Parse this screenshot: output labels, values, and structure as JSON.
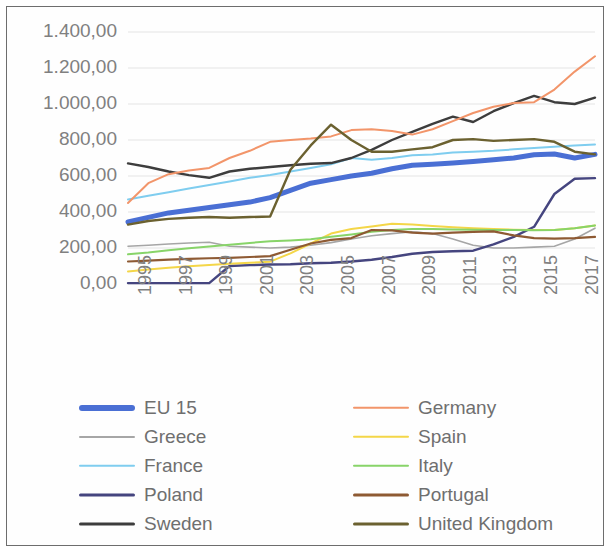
{
  "chart_data": {
    "type": "line",
    "title": "",
    "xlabel": "",
    "ylabel": "",
    "xlim": [
      1995,
      2018
    ],
    "ylim": [
      0,
      1400
    ],
    "grid": true,
    "legend_position": "bottom",
    "y_ticks": [
      "0,00",
      "200,00",
      "400,00",
      "600,00",
      "800,00",
      "1.000,00",
      "1.200,00",
      "1.400,00"
    ],
    "y_tick_values": [
      0,
      200,
      400,
      600,
      800,
      1000,
      1200,
      1400
    ],
    "x_tick_labels": [
      "1995",
      "1997",
      "1999",
      "2001",
      "2003",
      "2005",
      "2007",
      "2009",
      "2011",
      "2013",
      "2015",
      "2017"
    ],
    "x": [
      1995,
      1996,
      1997,
      1998,
      1999,
      2000,
      2001,
      2002,
      2003,
      2004,
      2005,
      2006,
      2007,
      2008,
      2009,
      2010,
      2011,
      2012,
      2013,
      2014,
      2015,
      2016,
      2017,
      2018
    ],
    "series": [
      {
        "name": "EU 15",
        "color": "#4a6fd4",
        "width": 5,
        "values": [
          345,
          370,
          395,
          410,
          425,
          440,
          455,
          480,
          520,
          560,
          580,
          600,
          615,
          640,
          660,
          665,
          672,
          680,
          690,
          700,
          718,
          722,
          700,
          720
        ]
      },
      {
        "name": "Greece",
        "color": "#a6a6a6",
        "width": 1.6,
        "values": [
          210,
          215,
          222,
          228,
          232,
          210,
          205,
          200,
          205,
          215,
          230,
          250,
          268,
          280,
          290,
          280,
          250,
          215,
          200,
          200,
          205,
          210,
          250,
          310
        ]
      },
      {
        "name": "France",
        "color": "#7fcdef",
        "width": 2,
        "values": [
          470,
          490,
          510,
          530,
          550,
          570,
          590,
          605,
          625,
          645,
          665,
          700,
          690,
          700,
          715,
          720,
          730,
          735,
          740,
          748,
          755,
          762,
          770,
          775
        ]
      },
      {
        "name": "Poland",
        "color": "#45457f",
        "width": 2.4,
        "values": [
          5,
          5,
          5,
          5,
          5,
          100,
          105,
          108,
          110,
          115,
          118,
          125,
          135,
          150,
          168,
          178,
          182,
          185,
          220,
          262,
          318,
          500,
          585,
          588
        ]
      },
      {
        "name": "Sweden",
        "color": "#3d3d3d",
        "width": 2.4,
        "values": [
          670,
          650,
          625,
          605,
          590,
          625,
          640,
          650,
          660,
          668,
          672,
          700,
          745,
          800,
          845,
          890,
          930,
          900,
          960,
          1005,
          1045,
          1010,
          1000,
          1035
        ]
      },
      {
        "name": "Germany",
        "color": "#f2956a",
        "width": 2,
        "values": [
          450,
          560,
          610,
          630,
          645,
          700,
          740,
          790,
          800,
          808,
          820,
          855,
          860,
          850,
          830,
          860,
          905,
          950,
          985,
          1005,
          1010,
          1080,
          1180,
          1265
        ]
      },
      {
        "name": "Spain",
        "color": "#f4d648",
        "width": 2,
        "values": [
          70,
          80,
          90,
          98,
          105,
          112,
          118,
          124,
          170,
          225,
          280,
          305,
          320,
          335,
          330,
          322,
          315,
          310,
          305,
          302,
          300,
          300,
          310,
          325
        ]
      },
      {
        "name": "Italy",
        "color": "#88d469",
        "width": 2,
        "values": [
          165,
          175,
          188,
          198,
          208,
          218,
          228,
          238,
          242,
          248,
          262,
          275,
          290,
          300,
          305,
          305,
          303,
          302,
          300,
          300,
          298,
          300,
          310,
          325
        ]
      },
      {
        "name": "Portugal",
        "color": "#8e5a33",
        "width": 2.2,
        "values": [
          125,
          130,
          135,
          140,
          143,
          145,
          150,
          155,
          190,
          225,
          245,
          255,
          300,
          298,
          285,
          280,
          285,
          290,
          292,
          270,
          255,
          252,
          255,
          262
        ]
      },
      {
        "name": "United Kingdom",
        "color": "#6b6130",
        "width": 2.4,
        "values": [
          330,
          350,
          362,
          368,
          372,
          368,
          372,
          375,
          635,
          770,
          885,
          800,
          735,
          735,
          748,
          760,
          800,
          805,
          795,
          800,
          805,
          790,
          735,
          720
        ]
      }
    ]
  },
  "legend": {
    "left_column": [
      {
        "label": "EU 15",
        "color": "#4a6fd4",
        "width": 6
      },
      {
        "label": "Greece",
        "color": "#a6a6a6",
        "width": 2
      },
      {
        "label": "France",
        "color": "#7fcdef",
        "width": 2.5
      },
      {
        "label": "Poland",
        "color": "#45457f",
        "width": 3
      },
      {
        "label": "Sweden",
        "color": "#3d3d3d",
        "width": 3
      }
    ],
    "right_column": [
      {
        "label": "Germany",
        "color": "#f2956a",
        "width": 2.5
      },
      {
        "label": "Spain",
        "color": "#f4d648",
        "width": 2.5
      },
      {
        "label": "Italy",
        "color": "#88d469",
        "width": 2.5
      },
      {
        "label": "Portugal",
        "color": "#8e5a33",
        "width": 3
      },
      {
        "label": "United Kingdom",
        "color": "#6b6130",
        "width": 3
      }
    ]
  },
  "style": {
    "frame_border_color": "#6d6d6d",
    "gridline_color": "#e4e4e4",
    "tick_text_color": "#808080",
    "legend_text_color": "#6f6f6f",
    "background": "#ffffff"
  }
}
